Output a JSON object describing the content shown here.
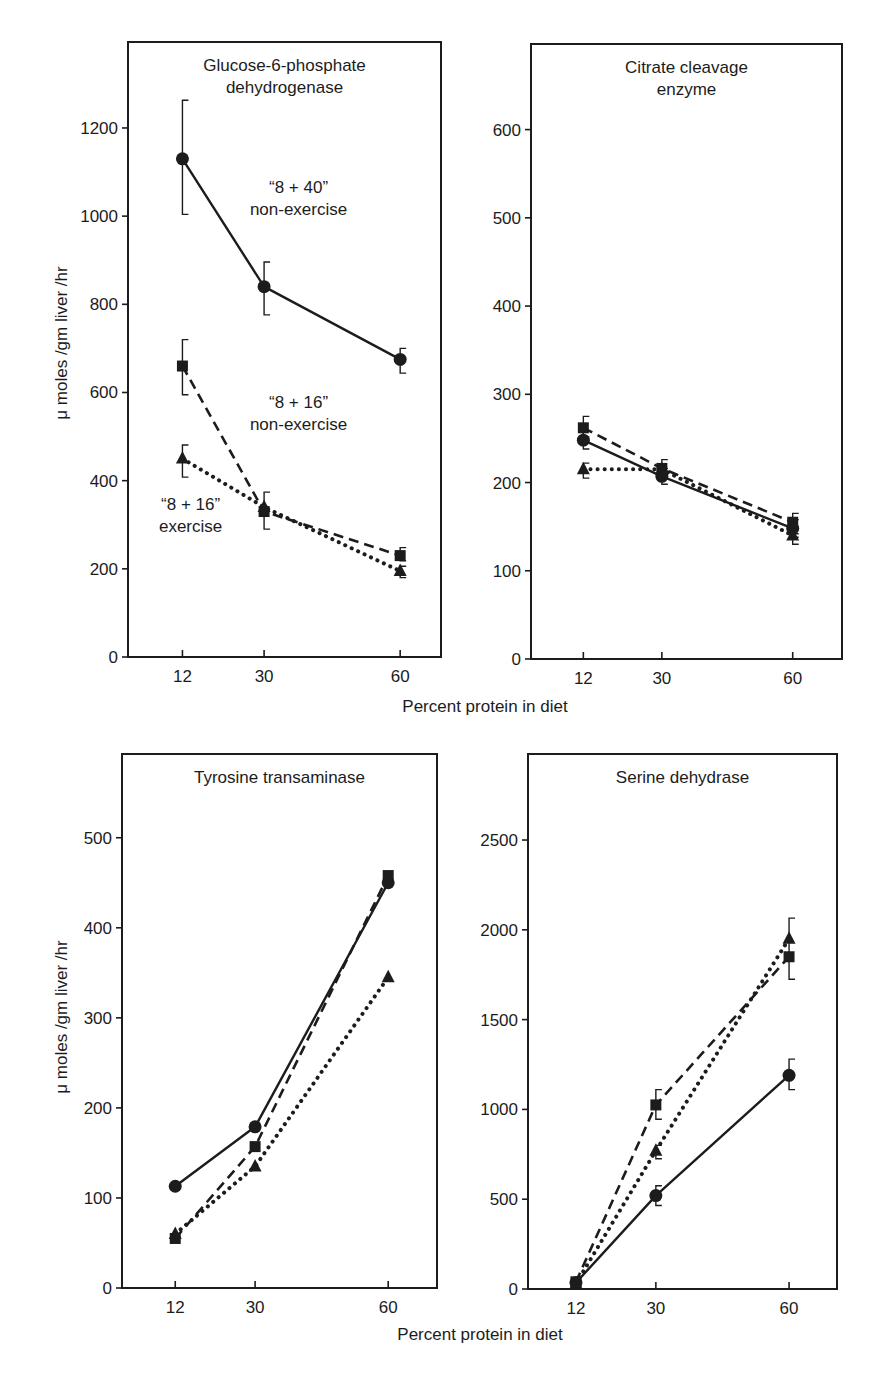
{
  "figure": {
    "x_axis_label_top": "Percent protein in diet",
    "x_axis_label_bottom": "Percent protein in diet",
    "y_axis_label_top": "μ moles /gm liver /hr",
    "y_axis_label_bottom": "μ moles /gm liver /hr",
    "ink_color": "#1c1c1c",
    "background_color": "#ffffff"
  },
  "chart_data": [
    {
      "type": "line",
      "title": "Glucose-6-phosphate dehydrogenase",
      "title_lines": [
        "Glucose-6-phosphate",
        "dehydrogenase"
      ],
      "xlabel": "Percent protein in diet",
      "ylabel": "μ moles /gm liver /hr",
      "x": [
        12,
        30,
        60
      ],
      "xticks": [
        12,
        30,
        60
      ],
      "yticks": [
        0,
        200,
        400,
        600,
        800,
        1000,
        1200
      ],
      "xlim": [
        0,
        69
      ],
      "ylim": [
        0,
        1395
      ],
      "grid": false,
      "legend": "inline annotations",
      "series": [
        {
          "name": "“8 + 40” non-exercise",
          "marker": "circle",
          "linestyle": "solid",
          "values": [
            1130,
            840,
            675
          ],
          "error": [
            [
              1004,
              1263
            ],
            [
              776,
              896
            ],
            [
              644,
              700
            ]
          ]
        },
        {
          "name": "“8 + 16” non-exercise",
          "marker": "square",
          "linestyle": "dashed",
          "values": [
            660,
            330,
            230
          ],
          "error": [
            [
              595,
              720
            ],
            [
              290,
              374
            ],
            [
              218,
              248
            ]
          ]
        },
        {
          "name": "“8 + 16” exercise",
          "marker": "triangle",
          "linestyle": "dotted",
          "values": [
            450,
            340,
            195
          ],
          "error": [
            [
              408,
              481
            ],
            null,
            [
              180,
              206
            ]
          ]
        }
      ],
      "annotations": [
        {
          "text": "“8 + 40”",
          "x": 37.6,
          "y": 1052
        },
        {
          "text": "non-exercise",
          "x": 37.6,
          "y": 1002
        },
        {
          "text": "“8 + 16”",
          "x": 37.6,
          "y": 564
        },
        {
          "text": "non-exercise",
          "x": 37.6,
          "y": 514
        },
        {
          "text": "“8 + 16”",
          "x": 13.8,
          "y": 333
        },
        {
          "text": "exercise",
          "x": 13.8,
          "y": 283
        }
      ]
    },
    {
      "type": "line",
      "title": "Citrate cleavage enzyme",
      "title_lines": [
        "Citrate cleavage",
        "enzyme"
      ],
      "xlabel": "Percent protein in diet",
      "ylabel": "",
      "x": [
        12,
        30,
        60
      ],
      "xticks": [
        12,
        30,
        60
      ],
      "yticks": [
        0,
        100,
        200,
        300,
        400,
        500,
        600
      ],
      "xlim": [
        0,
        71.3
      ],
      "ylim": [
        0,
        697
      ],
      "grid": false,
      "series": [
        {
          "name": "“8 + 40” non-exercise",
          "marker": "circle",
          "linestyle": "solid",
          "values": [
            248,
            207,
            148
          ],
          "error": [
            [
              238,
              258
            ],
            [
              198,
              216
            ],
            [
              138,
              158
            ]
          ]
        },
        {
          "name": "“8 + 16” non-exercise",
          "marker": "square",
          "linestyle": "dashed",
          "values": [
            262,
            216,
            155
          ],
          "error": [
            [
              252,
              275
            ],
            [
              205,
              226
            ],
            [
              142,
              165
            ]
          ]
        },
        {
          "name": "“8 + 16” exercise",
          "marker": "triangle",
          "linestyle": "dotted",
          "values": [
            215,
            215,
            140
          ],
          "error": [
            [
              205,
              222
            ],
            null,
            [
              130,
              148
            ]
          ]
        }
      ],
      "annotations": []
    },
    {
      "type": "line",
      "title": "Tyrosine transaminase",
      "title_lines": [
        "Tyrosine transaminase"
      ],
      "xlabel": "Percent protein in diet",
      "ylabel": "μ moles /gm liver /hr",
      "x": [
        12,
        30,
        60
      ],
      "xticks": [
        12,
        30,
        60
      ],
      "yticks": [
        0,
        100,
        200,
        300,
        400,
        500
      ],
      "xlim": [
        0,
        71
      ],
      "ylim": [
        0,
        593
      ],
      "grid": false,
      "series": [
        {
          "name": "“8 + 40” non-exercise",
          "marker": "circle",
          "linestyle": "solid",
          "values": [
            113,
            179,
            450
          ],
          "error": [
            null,
            null,
            null
          ]
        },
        {
          "name": "“8 + 16” non-exercise",
          "marker": "square",
          "linestyle": "dashed",
          "values": [
            55,
            157,
            458
          ],
          "error": [
            null,
            null,
            null
          ]
        },
        {
          "name": "“8 + 16” exercise",
          "marker": "triangle",
          "linestyle": "dotted",
          "values": [
            60,
            135,
            345
          ],
          "error": [
            null,
            null,
            null
          ]
        }
      ],
      "annotations": []
    },
    {
      "type": "line",
      "title": "Serine dehydrase",
      "title_lines": [
        "Serine dehydrase"
      ],
      "xlabel": "Percent protein in diet",
      "ylabel": "",
      "x": [
        12,
        30,
        60
      ],
      "xticks": [
        12,
        30,
        60
      ],
      "yticks": [
        0,
        500,
        1000,
        1500,
        2000,
        2500
      ],
      "xlim": [
        1.2,
        70.8
      ],
      "ylim": [
        0,
        2979
      ],
      "grid": false,
      "series": [
        {
          "name": "“8 + 40” non-exercise",
          "marker": "circle",
          "linestyle": "solid",
          "values": [
            35,
            520,
            1190
          ],
          "error": [
            null,
            [
              465,
              575
            ],
            [
              1110,
              1280
            ]
          ]
        },
        {
          "name": "“8 + 16” non-exercise",
          "marker": "square",
          "linestyle": "dashed",
          "values": [
            40,
            1025,
            1850
          ],
          "error": [
            null,
            [
              945,
              1110
            ],
            [
              1725,
              2065
            ]
          ]
        },
        {
          "name": "“8 + 16” exercise",
          "marker": "triangle",
          "linestyle": "dotted",
          "values": [
            30,
            770,
            1950
          ],
          "error": [
            null,
            [
              725,
              800
            ],
            null
          ]
        }
      ],
      "annotations": []
    }
  ]
}
